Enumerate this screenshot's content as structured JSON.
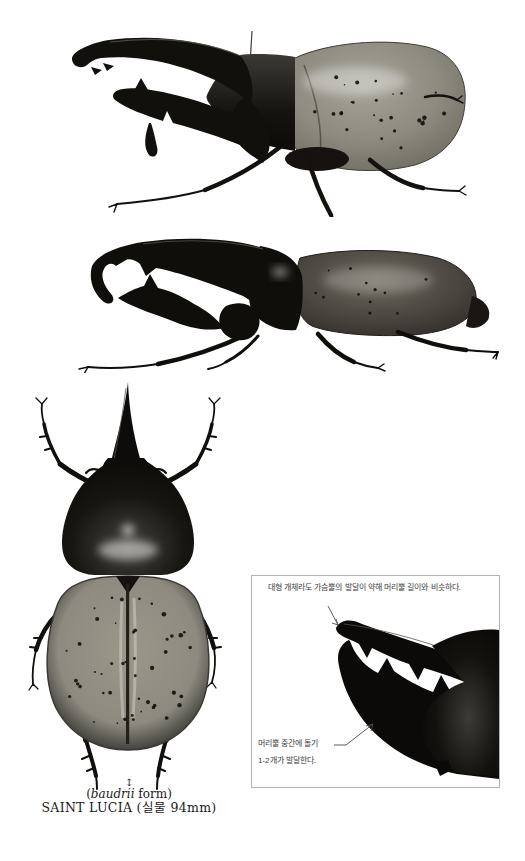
{
  "colors": {
    "background": "#ffffff",
    "beetle_black": "#12100d",
    "elytra_olive": "#8d8b80",
    "elytra_dark_olive": "#4a4640",
    "box_border": "#b3b3b3",
    "annotation_text": "#3d3d3d",
    "caption_text": "#1a1a1a",
    "arrow": "#4a4a4a"
  },
  "inset_box": {
    "note_top": "대형 개체라도 가슴뿔의 발달이 약해 머리뿔 길이와 비슷하다.",
    "note_bottom_line1": "머리뿔 중간에 돌기",
    "note_bottom_line2": "1-2개가 발달한다."
  },
  "caption": {
    "size_symbol": "↕",
    "form_open": "(",
    "form_name": "baudrii",
    "form_rest": " form)",
    "locality_line": "SAINT LUCIA (실물 94mm)"
  }
}
